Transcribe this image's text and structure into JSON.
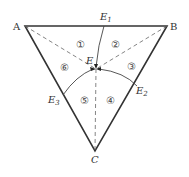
{
  "diagram": {
    "vertices": {
      "A": {
        "label": "A",
        "x": 25,
        "y": 26
      },
      "B": {
        "label": "B",
        "x": 167,
        "y": 26
      },
      "C": {
        "label": "C",
        "x": 95,
        "y": 151
      }
    },
    "center": {
      "label": "E",
      "x": 96,
      "y": 69
    },
    "edge_points": {
      "E1": {
        "label": "E",
        "sub": "1"
      },
      "E2": {
        "label": "E",
        "sub": "2"
      },
      "E3": {
        "label": "E",
        "sub": "3"
      }
    },
    "regions": [
      "①",
      "②",
      "③",
      "④",
      "⑤",
      "⑥"
    ],
    "colors": {
      "line": "#333333",
      "dashed": "#666666",
      "text": "#333333"
    }
  }
}
